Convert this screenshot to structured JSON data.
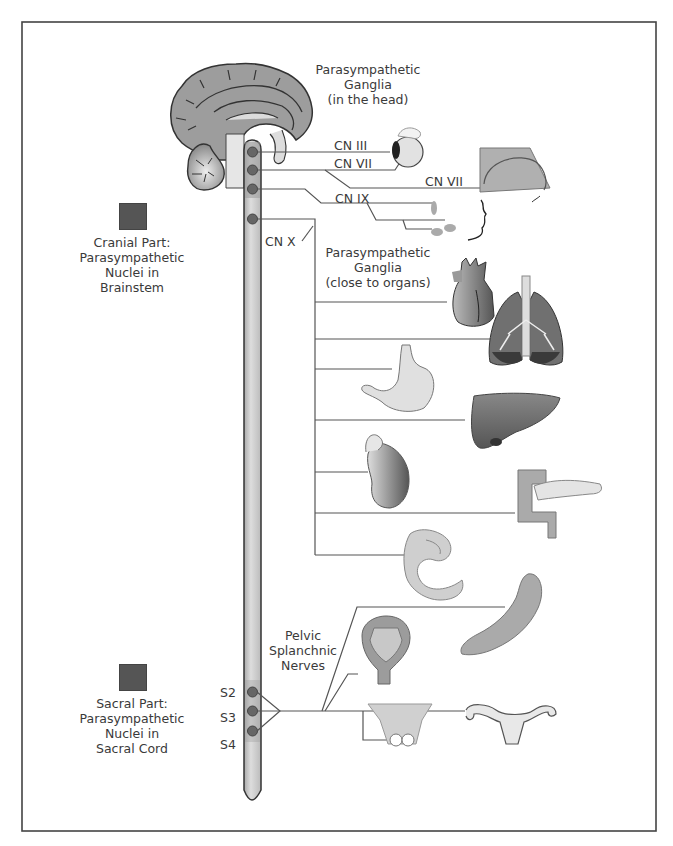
{
  "diagram": {
    "colors": {
      "frame": "#444444",
      "line": "#555555",
      "cord_fill": "#d0d0d0",
      "cord_cranial_fill": "#b5b5b5",
      "nucleus": "#666666",
      "legend_swatch": "#555555",
      "brain": "#9a9a9a"
    },
    "legend": {
      "cranial": {
        "line1": "Cranial Part:",
        "line2": "Parasympathetic",
        "line3": "Nuclei in",
        "line4": "Brainstem"
      },
      "sacral": {
        "line1": "Sacral Part:",
        "line2": "Parasympathetic",
        "line3": "Nuclei in",
        "line4": "Sacral Cord"
      }
    },
    "ganglia_head": {
      "line1": "Parasympathetic",
      "line2": "Ganglia",
      "line3": "(in the head)"
    },
    "ganglia_organs": {
      "line1": "Parasympathetic",
      "line2": "Ganglia",
      "line3": "(close to organs)"
    },
    "pelvic": {
      "line1": "Pelvic",
      "line2": "Splanchnic",
      "line3": "Nerves"
    },
    "cranial_nerves": [
      {
        "label": "CN III",
        "target": "eye"
      },
      {
        "label": "CN VII",
        "target": "eye / lacrimal gland"
      },
      {
        "label": "CN VII",
        "target": "nasal / palate glands"
      },
      {
        "label": "CN IX",
        "target": "parotid gland"
      },
      {
        "label": "CN X",
        "target": "thoracic & abdominal organs"
      }
    ],
    "sacral_levels": [
      "S2",
      "S3",
      "S4"
    ],
    "organs": [
      "brain",
      "eye",
      "nasal-cavity",
      "salivary-glands",
      "heart",
      "lungs",
      "stomach",
      "liver",
      "kidney",
      "pancreas",
      "small-intestine",
      "colon",
      "bladder",
      "male-genitalia",
      "uterus"
    ]
  }
}
